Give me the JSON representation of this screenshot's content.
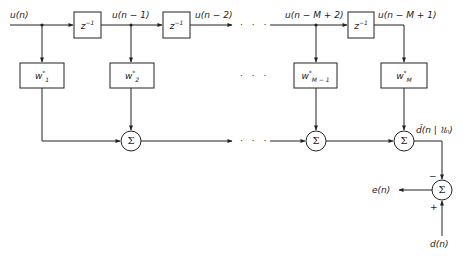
{
  "diagram": {
    "type": "transversal-filter-block-diagram",
    "input_signal": "u(n)",
    "delay_label": "z",
    "delay_exponent": "−1",
    "tap_labels": [
      "u(n − 1)",
      "u(n − 2)",
      "u(n − M + 2)",
      "u(n − M + 1)"
    ],
    "weights": [
      {
        "base": "w",
        "sup": "*",
        "sub": "1"
      },
      {
        "base": "w",
        "sup": "*",
        "sub": "2"
      },
      {
        "base": "w",
        "sup": "*",
        "sub": "M − 1"
      },
      {
        "base": "w",
        "sup": "*",
        "sub": "M"
      }
    ],
    "summer_symbol": "Σ",
    "ellipsis": "· · ·",
    "estimate_label": "d̂(n | 𝔘ₙ)",
    "error_label": "e(n)",
    "desired_label": "d(n)",
    "minus_sign": "−",
    "plus_sign": "+",
    "line_color": "#222222"
  }
}
